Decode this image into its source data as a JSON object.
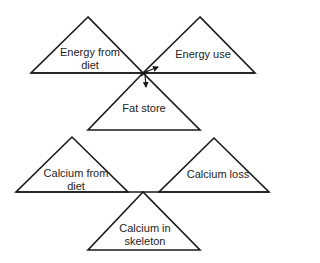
{
  "diagram": {
    "energy": {
      "input_label": "Energy from\ndiet",
      "output_label": "Energy use",
      "store_label": "Fat store"
    },
    "calcium": {
      "input_label": "Calcium from\ndiet",
      "output_label": "Calcium loss",
      "store_label": "Calcium in\nskeleton"
    },
    "colors": {
      "stroke": "#1a1a1a",
      "background": "#ffffff",
      "text": "#222222"
    }
  }
}
